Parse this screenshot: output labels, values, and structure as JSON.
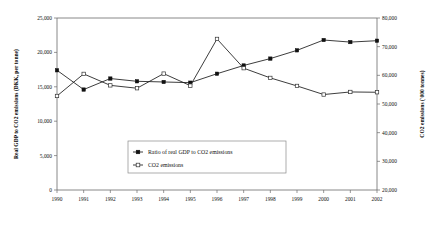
{
  "chart_data": {
    "type": "line",
    "title": "",
    "xlabel": "",
    "categories": [
      "1990",
      "1991",
      "1992",
      "1993",
      "1994",
      "1995",
      "1996",
      "1997",
      "1998",
      "1999",
      "2000",
      "2001",
      "2002"
    ],
    "grid": false,
    "legend_position": "inside-bottom-center",
    "left_axis": {
      "label": "Real GDP to CO2 emissions (DKK, per tonne)",
      "ylim": [
        0,
        25000
      ],
      "ticks": [
        0,
        5000,
        10000,
        15000,
        20000,
        25000
      ],
      "tick_labels": [
        "0",
        "5,000",
        "10,000",
        "15,000",
        "20,000",
        "25,000"
      ]
    },
    "right_axis": {
      "label": "CO2 emissions ('000 tonnes)",
      "ylim": [
        20000,
        80000
      ],
      "ticks": [
        20000,
        30000,
        40000,
        50000,
        60000,
        70000,
        80000
      ],
      "tick_labels": [
        "20,000",
        "30,000",
        "40,000",
        "50,000",
        "60,000",
        "70,000",
        "80,000"
      ]
    },
    "series": [
      {
        "name": "Ratio of real GDP to CO2 emissions",
        "axis": "left",
        "marker": "filled-square",
        "values": [
          17400,
          14600,
          16200,
          15800,
          15700,
          15600,
          16900,
          18100,
          19100,
          20300,
          21800,
          21500,
          21700
        ]
      },
      {
        "name": "CO2 emissions",
        "axis": "right",
        "marker": "open-square",
        "values": [
          52800,
          60500,
          56500,
          55500,
          60600,
          56400,
          72700,
          62500,
          59100,
          56300,
          53300,
          54200,
          54100
        ]
      }
    ]
  },
  "legend": {
    "entries": [
      {
        "label": "Ratio of real GDP to CO2 emissions"
      },
      {
        "label": "CO2 emissions"
      }
    ]
  }
}
